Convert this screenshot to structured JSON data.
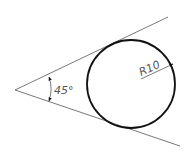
{
  "diagram": {
    "type": "technical-drawing",
    "angle_label": "45°",
    "radius_label": "R10",
    "colors": {
      "background": "#ffffff",
      "thin_line": "#555555",
      "thick_line": "#111111"
    }
  }
}
